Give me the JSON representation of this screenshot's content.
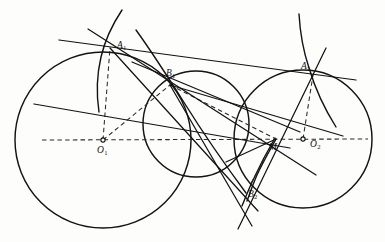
{
  "figure": {
    "width": 385,
    "height": 242,
    "background_color": "#fdfdfc",
    "ink_color": "#121212"
  },
  "labels": {
    "A1": {
      "text": "A",
      "sub": "1",
      "x": 117,
      "y": 41
    },
    "B1": {
      "text": "B",
      "sub": "1",
      "x": 166,
      "y": 69
    },
    "A2": {
      "text": "A",
      "sub": "2",
      "x": 301,
      "y": 62
    },
    "M": {
      "text": "M",
      "sub": "",
      "x": 269,
      "y": 143
    },
    "O1": {
      "text": "O",
      "sub": "1",
      "x": 97,
      "y": 146
    },
    "O2": {
      "text": "O",
      "sub": "2",
      "x": 310,
      "y": 140
    },
    "B2": {
      "text": "B",
      "sub": "2",
      "x": 248,
      "y": 190
    }
  },
  "points": {
    "A1": {
      "x": 110,
      "y": 48
    },
    "B1": {
      "x": 170,
      "y": 85
    },
    "A2": {
      "x": 313,
      "y": 75
    },
    "M": {
      "x": 276,
      "y": 139
    },
    "B2": {
      "x": 250,
      "y": 185
    },
    "O1": {
      "x": 103,
      "y": 140
    },
    "O2": {
      "x": 303,
      "y": 139
    }
  },
  "circles": [
    {
      "name": "circle-O1",
      "cx": 103,
      "cy": 140,
      "r": 88
    },
    {
      "name": "circle-middle",
      "cx": 196,
      "cy": 124,
      "r": 53
    },
    {
      "name": "circle-O2",
      "cx": 303,
      "cy": 139,
      "r": 69
    }
  ],
  "arcs": [
    {
      "name": "arc-through-A1",
      "d": "M 122 10 C 112 25 105 40 101 57 C 97 74 96 92 99 112"
    },
    {
      "name": "arc-through-B1-to-B2",
      "d": "M 136 30 C 152 52 166 74 185 104 C 205 136 226 166 246 193"
    },
    {
      "name": "arc-through-A2",
      "d": "M 299 14 C 300 32 303 50 309 68 C 315 88 324 108 336 127"
    },
    {
      "name": "arc-M-B2-lower",
      "d": "M 275 138 C 268 150 261 163 254 178 C 250 186 246 196 242 206"
    },
    {
      "name": "arc-M-B2-inner",
      "d": "M 276 139 C 270 150 263 162 257 175 C 253 184 250 193 247 201"
    }
  ],
  "lines": [
    {
      "name": "tangent-line-A1-A2",
      "x1": 59,
      "y1": 40,
      "x2": 356,
      "y2": 80
    },
    {
      "name": "line-A1-through-B1-M",
      "x1": 88,
      "y1": 29,
      "x2": 316,
      "y2": 175
    },
    {
      "name": "line-A1-to-B2",
      "x1": 110,
      "y1": 48,
      "x2": 258,
      "y2": 211
    },
    {
      "name": "line-B1-to-M-chord",
      "x1": 132,
      "y1": 62,
      "x2": 300,
      "y2": 132
    },
    {
      "name": "line-B1-to-M-long",
      "x1": 170,
      "y1": 85,
      "x2": 343,
      "y2": 136
    },
    {
      "name": "line-from-left-to-M",
      "x1": 34,
      "y1": 104,
      "x2": 290,
      "y2": 148
    },
    {
      "name": "line-A2-down-to-B2",
      "x1": 326,
      "y1": 48,
      "x2": 238,
      "y2": 229
    },
    {
      "name": "line-B1-down-B2",
      "x1": 170,
      "y1": 85,
      "x2": 252,
      "y2": 226
    },
    {
      "name": "line-M-short-left",
      "x1": 276,
      "y1": 139,
      "x2": 226,
      "y2": 162
    }
  ],
  "dashed": [
    {
      "name": "axis-O1-O2",
      "x1": 42,
      "y1": 140,
      "x2": 368,
      "y2": 139
    },
    {
      "name": "radius-O1-A1",
      "x1": 103,
      "y1": 140,
      "x2": 110,
      "y2": 48
    },
    {
      "name": "radius-O1-B1",
      "x1": 103,
      "y1": 140,
      "x2": 170,
      "y2": 85
    },
    {
      "name": "radius-O2-A2",
      "x1": 303,
      "y1": 139,
      "x2": 313,
      "y2": 75
    },
    {
      "name": "radius-M-B2",
      "x1": 276,
      "y1": 139,
      "x2": 250,
      "y2": 185
    },
    {
      "name": "chord-B1-M",
      "x1": 170,
      "y1": 85,
      "x2": 276,
      "y2": 139
    }
  ]
}
